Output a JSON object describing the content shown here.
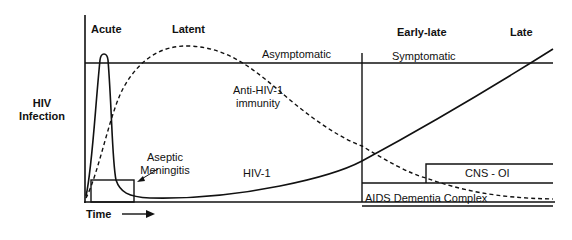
{
  "diagram": {
    "y_axis_label": [
      "HIV",
      "Infection"
    ],
    "x_axis_label": "Time",
    "x_axis_arrow": "arrow-right",
    "stages": [
      {
        "label": "Acute"
      },
      {
        "label": "Latent"
      },
      {
        "label": "Early-late"
      },
      {
        "label": "Late"
      }
    ],
    "phase_labels": {
      "asymptomatic": "Asymptomatic",
      "symptomatic": "Symptomatic"
    },
    "curves": {
      "anti_hiv_immunity": {
        "label_line1": "Anti-HIV-1",
        "label_line2": "immunity",
        "style": "dashed"
      },
      "hiv1": {
        "label": "HIV-1",
        "style": "solid"
      }
    },
    "boxes": {
      "aseptic_meningitis": {
        "label_line1": "Aseptic",
        "label_line2": "Meningitis"
      },
      "cns_oi": {
        "label": "CNS - OI"
      },
      "aids_dementia": {
        "label": "AIDS Dementia Complex"
      }
    },
    "colors": {
      "line": "#111111",
      "background": "#ffffff"
    }
  }
}
